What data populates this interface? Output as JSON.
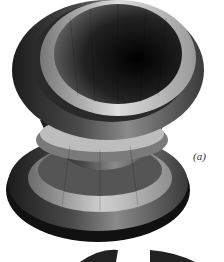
{
  "figure": {
    "panel_label": "(a)",
    "colors": {
      "background": "#ffffff",
      "dark": "#1a1a1a",
      "mid": "#5a5a5a",
      "light": "#c8c8c8"
    }
  }
}
